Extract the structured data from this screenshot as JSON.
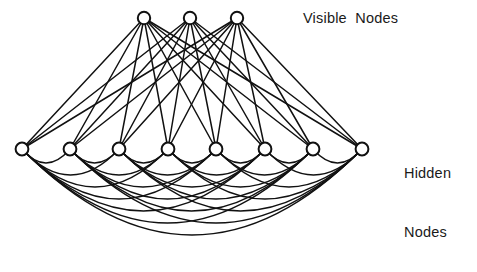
{
  "figure": {
    "title_present": false,
    "background": "#ffffff",
    "ink_color": "#111111",
    "node_fill": "#ffffff",
    "node_stroke": "#111111"
  },
  "labels": {
    "visible": "Visible  Nodes",
    "hidden_line1": "Hidden",
    "hidden_line2": "Nodes"
  },
  "chart_data": {
    "type": "diagram",
    "diagram_kind": "boltzmann-machine-network-graph",
    "title": "",
    "layers": [
      {
        "name": "Visible Nodes",
        "count": 3,
        "y": 18,
        "node_radius": 6.2,
        "nodes": [
          {
            "id": "v1",
            "x": 144,
            "y": 18
          },
          {
            "id": "v2",
            "x": 190,
            "y": 18
          },
          {
            "id": "v3",
            "x": 237,
            "y": 18
          }
        ]
      },
      {
        "name": "Hidden Nodes",
        "count": 8,
        "y": 149,
        "node_radius": 6.4,
        "nodes": [
          {
            "id": "h1",
            "x": 22,
            "y": 149
          },
          {
            "id": "h2",
            "x": 70,
            "y": 149
          },
          {
            "id": "h3",
            "x": 119,
            "y": 149
          },
          {
            "id": "h4",
            "x": 168,
            "y": 149
          },
          {
            "id": "h5",
            "x": 216,
            "y": 149
          },
          {
            "id": "h6",
            "x": 265,
            "y": 149
          },
          {
            "id": "h7",
            "x": 313,
            "y": 149
          },
          {
            "id": "h8",
            "x": 362,
            "y": 149
          }
        ]
      }
    ],
    "edges": {
      "visible_to_hidden": {
        "style": "straight",
        "complete_bipartite": true,
        "count": 24,
        "stroke_width": 1.5
      },
      "hidden_to_hidden": {
        "style": "arc-below",
        "complete_graph": true,
        "count": 28,
        "stroke_width": 1.4,
        "depth_per_span": [
          14,
          26,
          38,
          50,
          62,
          74,
          86
        ]
      }
    },
    "legend": [
      "Visible Nodes",
      "Hidden Nodes"
    ],
    "grid": false
  }
}
